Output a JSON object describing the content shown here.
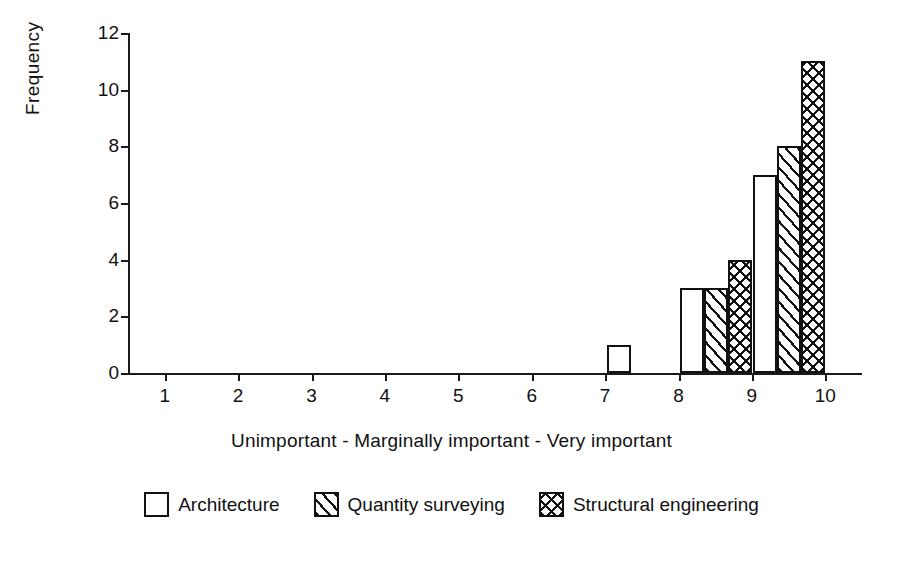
{
  "chart_data": {
    "type": "bar",
    "title": "",
    "subtitle": "",
    "xlabel": "Unimportant  -  Marginally important  -  Very important",
    "ylabel": "Frequency",
    "categories": [
      "1",
      "2",
      "3",
      "4",
      "5",
      "6",
      "7",
      "8",
      "9",
      "10"
    ],
    "xlim": [
      0.5,
      10.5
    ],
    "ylim": [
      0,
      12
    ],
    "yticks": [
      "0",
      "2",
      "4",
      "6",
      "8",
      "10",
      "12"
    ],
    "ytick_values": [
      0,
      2,
      4,
      6,
      8,
      10,
      12
    ],
    "grid": false,
    "legend_position": "bottom",
    "series": [
      {
        "name": "Architecture",
        "fill": "solid",
        "values": [
          0,
          0,
          0,
          0,
          0,
          0,
          0,
          1,
          3,
          7
        ]
      },
      {
        "name": "Quantity surveying",
        "fill": "diagonal",
        "values": [
          0,
          0,
          0,
          0,
          0,
          0,
          0,
          0,
          3,
          8
        ]
      },
      {
        "name": "Structural engineering",
        "fill": "cross",
        "values": [
          0,
          0,
          0,
          0,
          0,
          0,
          0,
          0,
          4,
          11
        ]
      }
    ]
  },
  "legend": {
    "items": [
      {
        "label": "Architecture",
        "fill": "solid"
      },
      {
        "label": "Quantity surveying",
        "fill": "diagonal"
      },
      {
        "label": "Structural engineering",
        "fill": "cross"
      }
    ]
  },
  "colors": {
    "ink": "#111111",
    "background": "#ffffff"
  }
}
